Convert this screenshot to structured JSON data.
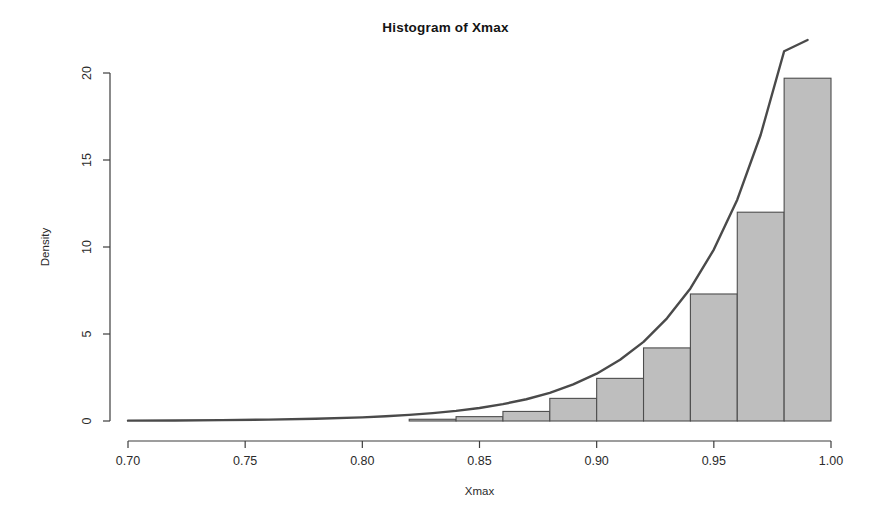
{
  "chart_data": {
    "type": "bar",
    "title": "Histogram of Xmax",
    "xlabel": "Xmax",
    "ylabel": "Density",
    "xlim": [
      0.7,
      1.0
    ],
    "ylim": [
      0,
      20.6
    ],
    "grid": false,
    "legend": null,
    "bin_width": 0.02,
    "bin_edges": [
      0.7,
      0.72,
      0.74,
      0.76,
      0.78,
      0.8,
      0.82,
      0.84,
      0.86,
      0.88,
      0.9,
      0.92,
      0.94,
      0.96,
      0.98,
      1.0
    ],
    "categories": [
      "0.70-0.72",
      "0.72-0.74",
      "0.74-0.76",
      "0.76-0.78",
      "0.78-0.80",
      "0.80-0.82",
      "0.82-0.84",
      "0.84-0.86",
      "0.86-0.88",
      "0.88-0.90",
      "0.90-0.92",
      "0.92-0.94",
      "0.94-0.96",
      "0.96-0.98",
      "0.98-1.00"
    ],
    "values": [
      0,
      0,
      0,
      0,
      0,
      0,
      0.1,
      0.25,
      0.55,
      1.3,
      2.45,
      4.2,
      7.3,
      12.0,
      19.7
    ],
    "xticks": [
      0.7,
      0.75,
      0.8,
      0.85,
      0.9,
      0.95,
      1.0
    ],
    "xtick_labels": [
      "0.70",
      "0.75",
      "0.80",
      "0.85",
      "0.90",
      "0.95",
      "1.00"
    ],
    "yticks": [
      0,
      5,
      10,
      15,
      20
    ],
    "ytick_labels": [
      "0",
      "5",
      "10",
      "15",
      "20"
    ],
    "bar_fill_color": "#bebebe",
    "bar_border_color": "#4d4d4d",
    "curve_color": "#4a4a4a",
    "series": [
      {
        "name": "density-curve",
        "type": "line",
        "x": [
          0.7,
          0.72,
          0.74,
          0.76,
          0.78,
          0.8,
          0.81,
          0.82,
          0.83,
          0.84,
          0.85,
          0.86,
          0.87,
          0.88,
          0.89,
          0.9,
          0.91,
          0.92,
          0.93,
          0.94,
          0.95,
          0.96,
          0.97,
          0.98,
          0.99,
          0.995
        ],
        "y": [
          0.02,
          0.03,
          0.05,
          0.08,
          0.13,
          0.21,
          0.27,
          0.35,
          0.45,
          0.58,
          0.75,
          0.97,
          1.25,
          1.62,
          2.1,
          2.72,
          3.52,
          4.55,
          5.9,
          7.62,
          9.85,
          12.72,
          16.45,
          21.25,
          27.4,
          30.8
        ]
      }
    ]
  },
  "axes": {
    "y_title": "Density",
    "x_title": "Xmax"
  }
}
